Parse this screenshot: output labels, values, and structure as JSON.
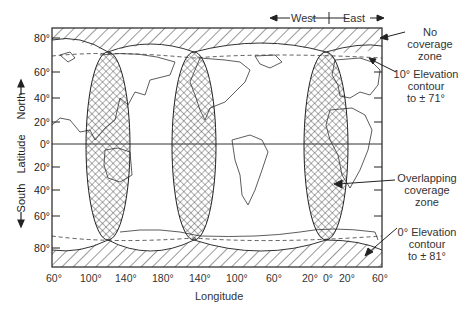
{
  "figure": {
    "direction_header": {
      "west": "West",
      "east": "East"
    },
    "y_axis": {
      "title": "Latitude",
      "north_label": "North",
      "south_label": "South",
      "ticks": [
        {
          "label": "80°",
          "y": 38
        },
        {
          "label": "60°",
          "y": 72
        },
        {
          "label": "40°",
          "y": 98
        },
        {
          "label": "20°",
          "y": 122
        },
        {
          "label": "0°",
          "y": 144
        },
        {
          "label": "20°",
          "y": 167
        },
        {
          "label": "40°",
          "y": 190
        },
        {
          "label": "60°",
          "y": 216
        },
        {
          "label": "80°",
          "y": 248
        }
      ]
    },
    "x_axis": {
      "title": "Longitude",
      "ticks": [
        {
          "label": "60°",
          "x": 60
        },
        {
          "label": "100°",
          "x": 97
        },
        {
          "label": "140°",
          "x": 125
        },
        {
          "label": "180°",
          "x": 161
        },
        {
          "label": "140°",
          "x": 196
        },
        {
          "label": "100°",
          "x": 233
        },
        {
          "label": "60°",
          "x": 272
        },
        {
          "label": "20°",
          "x": 308
        },
        {
          "label": "0°",
          "x": 329
        },
        {
          "label": "20°",
          "x": 346
        },
        {
          "label": "60°",
          "x": 377
        }
      ]
    },
    "annotations": {
      "no_coverage": [
        "No",
        "coverage",
        "zone"
      ],
      "ten_deg": [
        "10° Elevation",
        "contour",
        "to ± 71°"
      ],
      "overlap": [
        "Overlapping",
        "coverage",
        "zone"
      ],
      "zero_deg": [
        "0° Elevation",
        "contour",
        "to ± 81°"
      ]
    },
    "satellites": [
      {
        "name": "satellite-footprint-1",
        "cx": 108
      },
      {
        "name": "satellite-footprint-2",
        "cx": 194
      },
      {
        "name": "satellite-footprint-3",
        "cx": 326
      }
    ]
  }
}
